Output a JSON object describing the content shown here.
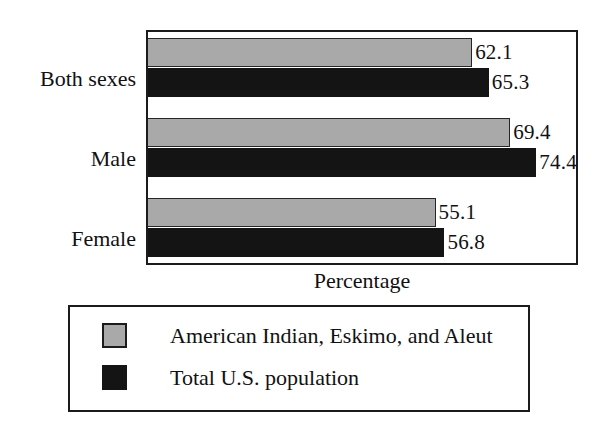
{
  "chart_data": {
    "type": "bar",
    "orientation": "horizontal",
    "title": "",
    "xlabel": "Percentage",
    "ylabel": "",
    "categories": [
      "Both sexes",
      "Male",
      "Female"
    ],
    "series": [
      {
        "name": "American Indian, Eskimo, and Aleut",
        "color": "#a9a9a9",
        "values": [
          62.1,
          69.4,
          55.1
        ],
        "labels": [
          "62.1",
          "69.4",
          "55.1"
        ]
      },
      {
        "name": "Total U.S. population",
        "color": "#141414",
        "values": [
          65.3,
          74.4,
          56.8
        ],
        "labels": [
          "65.3",
          "74.4",
          "56.8"
        ]
      }
    ],
    "xlim": [
      0,
      82
    ],
    "grid": false,
    "legend_position": "below-plot",
    "tick_labels": [],
    "annotations": []
  },
  "axis": {
    "x_title": "Percentage"
  },
  "legend": {
    "entries": [
      {
        "label": "American Indian, Eskimo, and Aleut",
        "swatch": "gray-swatch-icon"
      },
      {
        "label": "Total U.S. population",
        "swatch": "black-swatch-icon"
      }
    ]
  },
  "colors": {
    "series_gray": "#a9a9a9",
    "series_black": "#141414",
    "frame": "#1b1b1b",
    "text": "#111111",
    "background": "#ffffff"
  }
}
